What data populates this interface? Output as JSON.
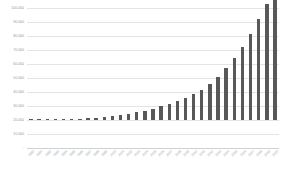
{
  "chart_data": {
    "type": "bar",
    "title": "",
    "subtitle": "",
    "xlabel": "",
    "ylabel": "",
    "grid": true,
    "legend": "none",
    "orientation": "vertical",
    "bar_color": "#585858",
    "gridline_color": "#e4e4e4",
    "axis_text_color": "#9a9a9a",
    "ylim": [
      0,
      100000
    ],
    "ytick_step": 10000,
    "ytick_labels": [
      "100,000",
      "90,000",
      "80,000",
      "70,000",
      "60,000",
      "50,000",
      "40,000",
      "30,000",
      "20,000",
      "10,000",
      "-"
    ],
    "ytick_values": [
      100000,
      90000,
      80000,
      70000,
      60000,
      50000,
      40000,
      30000,
      20000,
      10000,
      0
    ],
    "categories": [
      "1990",
      "1991",
      "1992",
      "1993",
      "1994",
      "1995",
      "1996",
      "1997",
      "1998",
      "1999",
      "2000",
      "2001",
      "2002",
      "2003",
      "2004",
      "2005",
      "2006",
      "2007",
      "2008",
      "2009",
      "2010",
      "2011",
      "2012",
      "2013",
      "2014",
      "2015",
      "2016",
      "2017",
      "2018",
      "2019",
      "2020"
    ],
    "values": [
      180,
      240,
      320,
      420,
      560,
      720,
      950,
      1250,
      1600,
      2100,
      2700,
      3400,
      4300,
      5400,
      6700,
      8200,
      9800,
      11500,
      13500,
      15800,
      18500,
      21500,
      25500,
      30500,
      37000,
      44000,
      52000,
      61500,
      72000,
      83000,
      92500
    ]
  }
}
